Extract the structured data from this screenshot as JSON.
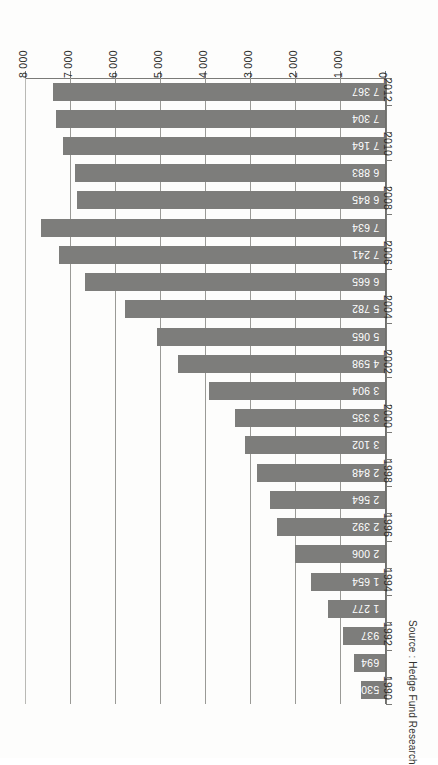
{
  "chart_data": {
    "type": "bar",
    "orientation": "horizontal",
    "title": "",
    "subtitle": "",
    "xlabel": "",
    "ylabel": "",
    "source": "Source : Hedge Fund Research",
    "xlim": [
      0,
      8000
    ],
    "x_axis_reversed": true,
    "grid": true,
    "legend": false,
    "legend_position": "none",
    "bar_color": "#7d7d7b",
    "value_label_color": "#ffffff",
    "axis_color": "#7a7a77",
    "gridline_color": "#9a9a96",
    "x_ticks": [
      "8 000",
      "7 000",
      "6 000",
      "5 000",
      "4 000",
      "3 000",
      "2 000",
      "1 000",
      "0"
    ],
    "x_tick_values": [
      8000,
      7000,
      6000,
      5000,
      4000,
      3000,
      2000,
      1000,
      0
    ],
    "categories": [
      "2012",
      "2011",
      "2010",
      "2009",
      "2008",
      "2007",
      "2006",
      "2005",
      "2004",
      "2003",
      "2002",
      "2001",
      "2000",
      "1999",
      "1998",
      "1997",
      "1996",
      "1995",
      "1994",
      "1993",
      "1992",
      "1991",
      "1990"
    ],
    "category_tick_labels": [
      "2012",
      "",
      "2010",
      "",
      "2008",
      "",
      "2006",
      "",
      "2004",
      "",
      "2002",
      "",
      "2000",
      "",
      "1998",
      "",
      "1996",
      "",
      "1994",
      "",
      "1992",
      "",
      "1990"
    ],
    "values": [
      7367,
      7304,
      7164,
      6883,
      6845,
      7634,
      7241,
      6665,
      5782,
      5065,
      4598,
      3904,
      3335,
      3102,
      2848,
      2564,
      2392,
      2006,
      1654,
      1277,
      937,
      694,
      530
    ],
    "value_labels": [
      "7 367",
      "7 304",
      "7 164",
      "6 883",
      "6 845",
      "7 634",
      "7 241",
      "6 665",
      "5 782",
      "5 065",
      "4 598",
      "3 904",
      "3 335",
      "3 102",
      "2 848",
      "2 564",
      "2 392",
      "2 006",
      "1 654",
      "1 277",
      "937",
      "694",
      "530"
    ]
  }
}
